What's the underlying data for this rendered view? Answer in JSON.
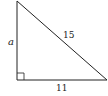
{
  "diagram": {
    "type": "right-triangle",
    "colors": {
      "stroke": "#222222",
      "text": "#222222",
      "background": "#ffffff"
    },
    "vertices": {
      "top": [
        17,
        1
      ],
      "right_angle": [
        17,
        80
      ],
      "right": [
        107,
        80
      ]
    },
    "labels": {
      "vertical_leg": "a",
      "hypotenuse": "15",
      "horizontal_leg": "11"
    },
    "right_angle_marker": true
  }
}
